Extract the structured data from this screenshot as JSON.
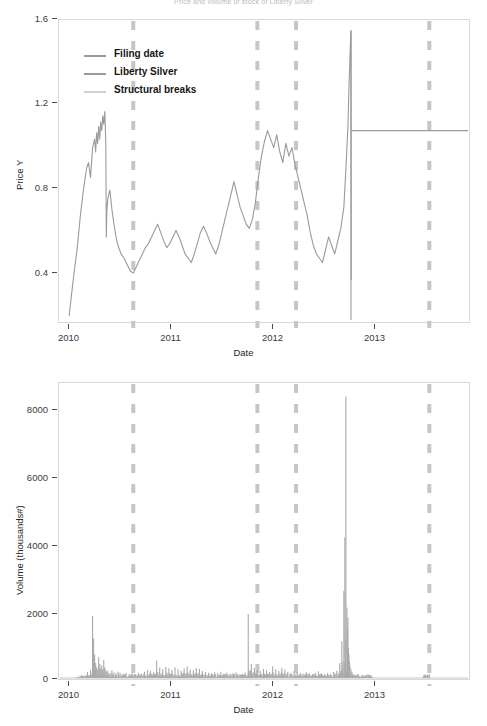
{
  "figure": {
    "title": "Price and volume of stock of Liberty Silver",
    "background": "#ffffff"
  },
  "colors": {
    "price_line": "#9a9a9a",
    "volume_bar": "#a8a8a8",
    "break_line": "#c6c6c6",
    "frame": "#d9d9d9",
    "text": "#262626",
    "tick": "#4a4a4a"
  },
  "legend": {
    "position": "top-left-inside",
    "items": [
      {
        "label": "Filing date",
        "color": "#9a9a9a",
        "style": "solid"
      },
      {
        "label": "Liberty Silver",
        "color": "#9a9a9a",
        "style": "solid"
      },
      {
        "label": "Structural breaks",
        "color": "#c6c6c6",
        "style": "dashed"
      }
    ]
  },
  "chart_data": [
    {
      "id": "price-panel",
      "type": "line",
      "title": "",
      "xlabel": "Date",
      "ylabel": "Price Y",
      "xlim": [
        2009.92,
        2013.95
      ],
      "ylim": [
        0.2,
        1.62
      ],
      "xticks": [
        2010,
        2011,
        2012,
        2013
      ],
      "xticklabels": [
        "2010",
        "2011",
        "2012",
        "2013"
      ],
      "yticks": [
        0.4,
        0.8,
        1.2,
        1.6
      ],
      "yticklabels": [
        "0.4",
        "0.8",
        "1.2",
        "1.6"
      ],
      "grid": false,
      "legend": [
        "Filing date",
        "Liberty Silver",
        "Structural breaks"
      ],
      "annotations": {
        "structural_breaks_x": [
          2010.65,
          2011.87,
          2012.25,
          2013.56
        ],
        "filing_date_x": 2012.79,
        "post_filing_flat_level": 1.1,
        "series_note": "Liberty Silver daily closing price; vertical dashed lines mark estimated structural breaks; a vertical solid line marks the filing date after which the price is flat at 1.10."
      },
      "series": [
        {
          "name": "Liberty Silver",
          "color": "#9a9a9a",
          "x": [
            2010.02,
            2010.06,
            2010.1,
            2010.13,
            2010.16,
            2010.19,
            2010.21,
            2010.23,
            2010.25,
            2010.27,
            2010.28,
            2010.29,
            2010.3,
            2010.31,
            2010.32,
            2010.33,
            2010.34,
            2010.35,
            2010.36,
            2010.37,
            2010.375,
            2010.38,
            2010.385,
            2010.39,
            2010.4,
            2010.42,
            2010.44,
            2010.46,
            2010.48,
            2010.5,
            2010.53,
            2010.56,
            2010.59,
            2010.62,
            2010.65,
            2010.68,
            2010.71,
            2010.74,
            2010.77,
            2010.8,
            2010.83,
            2010.86,
            2010.89,
            2010.92,
            2010.95,
            2010.98,
            2011.01,
            2011.04,
            2011.07,
            2011.1,
            2011.13,
            2011.16,
            2011.19,
            2011.22,
            2011.25,
            2011.28,
            2011.31,
            2011.34,
            2011.37,
            2011.4,
            2011.43,
            2011.46,
            2011.49,
            2011.52,
            2011.55,
            2011.58,
            2011.61,
            2011.64,
            2011.67,
            2011.7,
            2011.73,
            2011.76,
            2011.79,
            2011.82,
            2011.85,
            2011.88,
            2011.91,
            2011.94,
            2011.97,
            2012.0,
            2012.03,
            2012.06,
            2012.09,
            2012.12,
            2012.15,
            2012.18,
            2012.21,
            2012.24,
            2012.27,
            2012.3,
            2012.33,
            2012.36,
            2012.39,
            2012.42,
            2012.45,
            2012.48,
            2012.51,
            2012.54,
            2012.57,
            2012.6,
            2012.63,
            2012.66,
            2012.69,
            2012.72,
            2012.74,
            2012.76,
            2012.77,
            2012.78,
            2012.785,
            2012.79,
            2012.792,
            2012.8,
            2013.0,
            2013.4,
            2013.8,
            2013.92
          ],
          "y": [
            0.23,
            0.4,
            0.55,
            0.7,
            0.82,
            0.92,
            0.95,
            0.88,
            1.02,
            1.06,
            1.0,
            1.09,
            1.04,
            1.12,
            1.06,
            1.14,
            1.1,
            1.17,
            1.13,
            1.19,
            1.12,
            1.04,
            0.6,
            0.72,
            0.78,
            0.82,
            0.73,
            0.66,
            0.6,
            0.56,
            0.52,
            0.5,
            0.47,
            0.44,
            0.43,
            0.46,
            0.49,
            0.52,
            0.55,
            0.57,
            0.6,
            0.63,
            0.66,
            0.62,
            0.58,
            0.55,
            0.57,
            0.6,
            0.63,
            0.6,
            0.56,
            0.52,
            0.5,
            0.48,
            0.52,
            0.57,
            0.62,
            0.65,
            0.62,
            0.58,
            0.55,
            0.52,
            0.56,
            0.62,
            0.68,
            0.74,
            0.8,
            0.86,
            0.8,
            0.74,
            0.7,
            0.66,
            0.64,
            0.68,
            0.76,
            0.88,
            0.98,
            1.05,
            1.1,
            1.06,
            1.02,
            1.08,
            1.0,
            0.95,
            1.04,
            0.98,
            1.02,
            0.94,
            0.88,
            0.82,
            0.76,
            0.7,
            0.62,
            0.56,
            0.52,
            0.5,
            0.48,
            0.54,
            0.6,
            0.56,
            0.52,
            0.58,
            0.64,
            0.74,
            0.92,
            1.12,
            1.3,
            1.45,
            1.52,
            1.57,
            0.4,
            0.27,
            1.1,
            1.1,
            1.1,
            1.1
          ]
        }
      ]
    },
    {
      "id": "volume-panel",
      "type": "bar",
      "title": "",
      "xlabel": "Date",
      "ylabel": "Volume (thousands#)",
      "xlim": [
        2009.92,
        2013.95
      ],
      "ylim": [
        0,
        8800
      ],
      "xticks": [
        2010,
        2011,
        2012,
        2013
      ],
      "xticklabels": [
        "2010",
        "2011",
        "2012",
        "2013"
      ],
      "yticks": [
        0,
        2000,
        4000,
        6000,
        8000
      ],
      "yticklabels": [
        "0",
        "2000",
        "4000",
        "6000",
        "8000"
      ],
      "grid": false,
      "annotations": {
        "structural_breaks_x": [
          2010.65,
          2011.87,
          2012.25,
          2013.56
        ],
        "max_volume": 8400,
        "max_volume_x": 2012.76,
        "series_note": "Daily traded volume in thousands of shares; the largest spike of about 8400 occurs just before the filing date."
      },
      "series": [
        {
          "name": "Volume",
          "color": "#a8a8a8",
          "x": [
            2010.1,
            2010.16,
            2010.2,
            2010.23,
            2010.25,
            2010.26,
            2010.27,
            2010.28,
            2010.29,
            2010.3,
            2010.31,
            2010.32,
            2010.33,
            2010.34,
            2010.35,
            2010.36,
            2010.37,
            2010.38,
            2010.39,
            2010.4,
            2010.42,
            2010.44,
            2010.46,
            2010.48,
            2010.5,
            2010.52,
            2010.55,
            2010.58,
            2010.61,
            2010.64,
            2010.67,
            2010.7,
            2010.73,
            2010.76,
            2010.79,
            2010.82,
            2010.85,
            2010.88,
            2010.91,
            2010.94,
            2010.97,
            2011.0,
            2011.03,
            2011.06,
            2011.09,
            2011.12,
            2011.15,
            2011.18,
            2011.21,
            2011.24,
            2011.27,
            2011.3,
            2011.33,
            2011.36,
            2011.39,
            2011.42,
            2011.45,
            2011.48,
            2011.51,
            2011.54,
            2011.57,
            2011.6,
            2011.63,
            2011.66,
            2011.69,
            2011.72,
            2011.75,
            2011.78,
            2011.81,
            2011.84,
            2011.87,
            2011.9,
            2011.93,
            2011.96,
            2011.99,
            2012.02,
            2012.05,
            2012.08,
            2012.11,
            2012.14,
            2012.17,
            2012.2,
            2012.23,
            2012.26,
            2012.29,
            2012.32,
            2012.35,
            2012.38,
            2012.41,
            2012.44,
            2012.47,
            2012.5,
            2012.53,
            2012.56,
            2012.59,
            2012.62,
            2012.65,
            2012.68,
            2012.7,
            2012.72,
            2012.73,
            2012.74,
            2012.75,
            2012.755,
            2012.76,
            2012.765,
            2012.77,
            2012.775,
            2012.78,
            2012.79,
            2012.8,
            2013.56
          ],
          "y": [
            40,
            60,
            180,
            240,
            1850,
            1180,
            700,
            450,
            320,
            260,
            620,
            420,
            300,
            380,
            260,
            540,
            320,
            240,
            180,
            210,
            150,
            230,
            170,
            140,
            190,
            160,
            120,
            150,
            110,
            140,
            120,
            160,
            130,
            190,
            240,
            210,
            180,
            520,
            310,
            260,
            330,
            290,
            240,
            320,
            260,
            220,
            280,
            340,
            250,
            230,
            300,
            270,
            210,
            180,
            160,
            140,
            170,
            150,
            190,
            130,
            160,
            120,
            140,
            170,
            110,
            130,
            160,
            1900,
            420,
            300,
            240,
            200,
            270,
            230,
            180,
            350,
            260,
            210,
            300,
            250,
            190,
            160,
            210,
            180,
            150,
            130,
            170,
            140,
            120,
            160,
            200,
            140,
            110,
            150,
            130,
            180,
            210,
            450,
            1100,
            2600,
            4200,
            8400,
            2100,
            1500,
            1800,
            900,
            700,
            500,
            360,
            260,
            180,
            120
          ]
        }
      ]
    }
  ]
}
